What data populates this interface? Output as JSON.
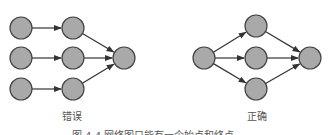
{
  "diagram": {
    "colors": {
      "node_fill": "#a9a9a9",
      "node_stroke": "#444444",
      "edge": "#333333",
      "text": "#555555"
    },
    "wrong": {
      "label": "错误",
      "nodes": [
        {
          "id": "a1",
          "x": 21,
          "y": 28
        },
        {
          "id": "a2",
          "x": 21,
          "y": 58
        },
        {
          "id": "a3",
          "x": 21,
          "y": 89
        },
        {
          "id": "b1",
          "x": 73,
          "y": 28
        },
        {
          "id": "b2",
          "x": 73,
          "y": 58
        },
        {
          "id": "b3",
          "x": 73,
          "y": 89
        },
        {
          "id": "c",
          "x": 124,
          "y": 58
        }
      ],
      "edges": [
        [
          "a1",
          "b1"
        ],
        [
          "a2",
          "b2"
        ],
        [
          "a3",
          "b3"
        ],
        [
          "b1",
          "c"
        ],
        [
          "b2",
          "c"
        ],
        [
          "b3",
          "c"
        ]
      ]
    },
    "right": {
      "label": "正确",
      "nodes": [
        {
          "id": "s",
          "x": 204,
          "y": 58
        },
        {
          "id": "m1",
          "x": 256,
          "y": 26
        },
        {
          "id": "m2",
          "x": 256,
          "y": 58
        },
        {
          "id": "m3",
          "x": 256,
          "y": 89
        },
        {
          "id": "e",
          "x": 310,
          "y": 58
        }
      ],
      "edges": [
        [
          "s",
          "m1"
        ],
        [
          "s",
          "m2"
        ],
        [
          "s",
          "m3"
        ],
        [
          "m1",
          "e"
        ],
        [
          "m2",
          "e"
        ],
        [
          "m3",
          "e"
        ]
      ]
    },
    "caption": "图 4-4  网络图只能有一个始点和终点"
  }
}
